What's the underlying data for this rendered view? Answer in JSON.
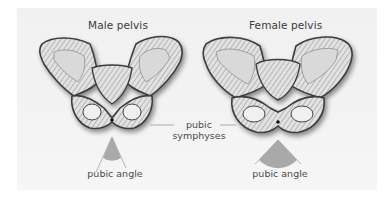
{
  "panels": [
    {
      "title": "Male pelvis",
      "angle_label": "pubic angle",
      "angle_type": "narrow"
    },
    {
      "title": "Female pelvis",
      "angle_label": "pubic angle",
      "angle_type": "wide"
    }
  ],
  "shared_label": {
    "line1": "pubic",
    "line2": "symphyses"
  },
  "colors": {
    "panel_bg": "#f2f2f2",
    "bone_dark": "#3c3c3c",
    "bone_light": "#d8d8d8",
    "angle_fill": "#a9a9a9",
    "leader_line": "#9a9a9a"
  }
}
